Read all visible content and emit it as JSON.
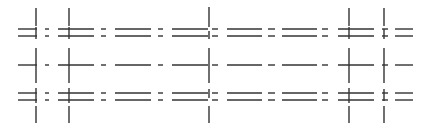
{
  "diagram": {
    "width": 428,
    "height": 132,
    "background": "#ffffff",
    "stroke_color": "#333333",
    "stroke_width": 1.4,
    "horizontal_rows": [
      {
        "name": "top-upper",
        "y": 29,
        "segments": [
          [
            18,
            37
          ],
          [
            45,
            49
          ],
          [
            58,
            94
          ],
          [
            101,
            106
          ],
          [
            115,
            151
          ],
          [
            158,
            163
          ],
          [
            172,
            208
          ],
          [
            212,
            218
          ],
          [
            227,
            262
          ],
          [
            268,
            275
          ],
          [
            282,
            317
          ],
          [
            322,
            328
          ],
          [
            338,
            374
          ],
          [
            382,
            388
          ],
          [
            395,
            413
          ]
        ]
      },
      {
        "name": "top-lower",
        "y": 36,
        "segments": [
          [
            18,
            37
          ],
          [
            45,
            49
          ],
          [
            58,
            94
          ],
          [
            101,
            106
          ],
          [
            115,
            151
          ],
          [
            158,
            163
          ],
          [
            172,
            208
          ],
          [
            212,
            218
          ],
          [
            227,
            262
          ],
          [
            268,
            275
          ],
          [
            282,
            317
          ],
          [
            322,
            328
          ],
          [
            338,
            374
          ],
          [
            382,
            388
          ],
          [
            395,
            413
          ]
        ]
      },
      {
        "name": "middle",
        "y": 65,
        "segments": [
          [
            18,
            37
          ],
          [
            45,
            49
          ],
          [
            58,
            94
          ],
          [
            101,
            106
          ],
          [
            115,
            151
          ],
          [
            158,
            163
          ],
          [
            172,
            208
          ],
          [
            212,
            218
          ],
          [
            227,
            262
          ],
          [
            268,
            275
          ],
          [
            282,
            317
          ],
          [
            322,
            328
          ],
          [
            338,
            374
          ],
          [
            382,
            388
          ],
          [
            395,
            413
          ]
        ]
      },
      {
        "name": "bottom-upper",
        "y": 93,
        "segments": [
          [
            18,
            37
          ],
          [
            45,
            49
          ],
          [
            58,
            94
          ],
          [
            101,
            106
          ],
          [
            115,
            151
          ],
          [
            158,
            163
          ],
          [
            172,
            208
          ],
          [
            212,
            218
          ],
          [
            227,
            262
          ],
          [
            268,
            275
          ],
          [
            282,
            317
          ],
          [
            322,
            328
          ],
          [
            338,
            374
          ],
          [
            382,
            388
          ],
          [
            395,
            413
          ]
        ]
      },
      {
        "name": "bottom-lower",
        "y": 100,
        "segments": [
          [
            18,
            37
          ],
          [
            45,
            49
          ],
          [
            58,
            94
          ],
          [
            101,
            106
          ],
          [
            115,
            151
          ],
          [
            158,
            163
          ],
          [
            172,
            208
          ],
          [
            212,
            218
          ],
          [
            227,
            262
          ],
          [
            268,
            275
          ],
          [
            282,
            317
          ],
          [
            322,
            328
          ],
          [
            338,
            374
          ],
          [
            382,
            388
          ],
          [
            395,
            413
          ]
        ]
      }
    ],
    "vertical_lines": [
      {
        "name": "v1",
        "x": 36,
        "segments": [
          [
            8,
            26
          ],
          [
            27,
            39
          ],
          [
            48,
            83
          ],
          [
            88,
            103
          ],
          [
            106,
            123
          ]
        ]
      },
      {
        "name": "v2",
        "x": 69,
        "segments": [
          [
            8,
            26
          ],
          [
            27,
            39
          ],
          [
            48,
            83
          ],
          [
            88,
            103
          ],
          [
            106,
            123
          ]
        ]
      },
      {
        "name": "v3",
        "x": 209,
        "segments": [
          [
            7,
            27
          ],
          [
            31,
            39
          ],
          [
            48,
            83
          ],
          [
            89,
            98
          ],
          [
            106,
            123
          ]
        ]
      },
      {
        "name": "v4",
        "x": 349,
        "segments": [
          [
            8,
            26
          ],
          [
            27,
            39
          ],
          [
            48,
            83
          ],
          [
            88,
            103
          ],
          [
            106,
            123
          ]
        ]
      },
      {
        "name": "v5",
        "x": 384,
        "segments": [
          [
            8,
            26
          ],
          [
            29,
            39
          ],
          [
            48,
            83
          ],
          [
            89,
            101
          ],
          [
            106,
            123
          ]
        ]
      }
    ]
  }
}
